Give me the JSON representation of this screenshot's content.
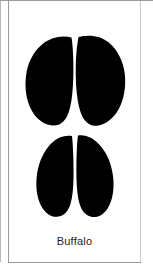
{
  "card": {
    "caption": "Buffalo",
    "illustration_name": "buffalo-hoof-track",
    "ink_color": "#000000",
    "background_color": "#ffffff",
    "caption_color": "#1d1d1d",
    "border_color": "#9a9a9a"
  },
  "figure": {
    "parts": [
      {
        "name": "front-hoof-print",
        "position": "upper",
        "shape": "broad rounded pair of lobes split by a curved vertical cleft"
      },
      {
        "name": "rear-hoof-print",
        "position": "lower",
        "shape": "narrower tapered pair of lobes split by a straight vertical cleft"
      }
    ]
  }
}
